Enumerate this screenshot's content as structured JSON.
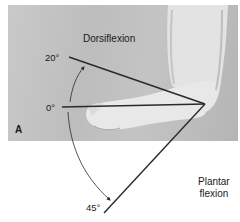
{
  "figure": {
    "panel_label": "A",
    "labels": {
      "dorsiflexion": "Dorsiflexion",
      "plantar_flexion_line1": "Plantar",
      "plantar_flexion_line2": "flexion",
      "angle_dorsiflexion": "20°",
      "angle_neutral": "0°",
      "angle_plantar_flexion": "45°"
    },
    "colors": {
      "line": "#2a2a2a",
      "photo_background": "#c2c2c2",
      "skin": "#e6e6e6",
      "page": "#ffffff"
    },
    "range_of_motion": {
      "joint": "ankle",
      "dorsiflexion_deg": 20,
      "neutral_deg": 0,
      "plantar_flexion_deg": 45
    }
  }
}
